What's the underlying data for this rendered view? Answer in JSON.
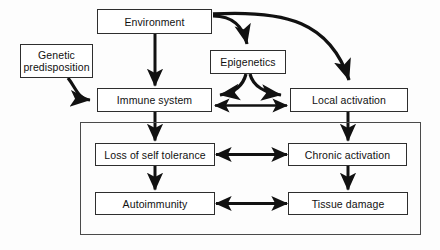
{
  "diagram": {
    "background_color": "#fdfdfd",
    "line_color": "#111111",
    "box_border_color": "#2e2e2e",
    "box_fill_color": "#ffffff",
    "group_border_color": "#4a4a4a",
    "nodes": [
      {
        "id": "environment",
        "label": "Environment",
        "x": 97,
        "y": 9,
        "w": 115,
        "h": 25
      },
      {
        "id": "genetic_predisposition",
        "label": "Genetic\npredisposition",
        "x": 20,
        "y": 44,
        "w": 73,
        "h": 34
      },
      {
        "id": "epigenetics",
        "label": "Epigenetics",
        "x": 210,
        "y": 50,
        "w": 76,
        "h": 24
      },
      {
        "id": "immune_system",
        "label": "Immune system",
        "x": 97,
        "y": 88,
        "w": 115,
        "h": 24
      },
      {
        "id": "local_activation",
        "label": "Local activation",
        "x": 290,
        "y": 88,
        "w": 118,
        "h": 24
      },
      {
        "id": "loss_of_self_tolerance",
        "label": "Loss of self tolerance",
        "x": 95,
        "y": 143,
        "w": 120,
        "h": 23
      },
      {
        "id": "chronic_activation",
        "label": "Chronic activation",
        "x": 288,
        "y": 143,
        "w": 119,
        "h": 23
      },
      {
        "id": "autoimmunity",
        "label": "Autoimmunity",
        "x": 95,
        "y": 192,
        "w": 120,
        "h": 23
      },
      {
        "id": "tissue_damage",
        "label": "Tissue damage",
        "x": 288,
        "y": 192,
        "w": 120,
        "h": 23
      }
    ],
    "group": {
      "id": "disease-process-group",
      "x": 80,
      "y": 122,
      "w": 341,
      "h": 113
    },
    "edges": [
      {
        "id": "environment-to-immune-system",
        "from": "environment",
        "to": "immune_system",
        "style": "straight-vertical",
        "heads": "end"
      },
      {
        "id": "environment-to-epigenetics",
        "from": "environment",
        "to": "epigenetics",
        "style": "curved",
        "heads": "end"
      },
      {
        "id": "environment-to-local-activation",
        "from": "environment",
        "to": "local_activation",
        "style": "curved-long",
        "heads": "end"
      },
      {
        "id": "genetic-predisposition-to-immune-system",
        "from": "genetic_predisposition",
        "to": "immune_system",
        "style": "curved",
        "heads": "end"
      },
      {
        "id": "epigenetics-to-immune-system",
        "from": "epigenetics",
        "to": "immune_system",
        "style": "curved",
        "heads": "end"
      },
      {
        "id": "epigenetics-to-local-activation",
        "from": "epigenetics",
        "to": "local_activation",
        "style": "curved",
        "heads": "end"
      },
      {
        "id": "immune-system-local-activation-bidirectional",
        "from": "immune_system",
        "to": "local_activation",
        "style": "straight-horizontal",
        "heads": "both"
      },
      {
        "id": "immune-system-to-loss-of-self-tolerance",
        "from": "immune_system",
        "to": "loss_of_self_tolerance",
        "style": "straight-vertical",
        "heads": "end"
      },
      {
        "id": "local-activation-to-chronic-activation",
        "from": "local_activation",
        "to": "chronic_activation",
        "style": "straight-vertical",
        "heads": "end"
      },
      {
        "id": "loss-of-self-tolerance-chronic-activation-bidirectional",
        "from": "loss_of_self_tolerance",
        "to": "chronic_activation",
        "style": "straight-horizontal",
        "heads": "both"
      },
      {
        "id": "loss-of-self-tolerance-to-autoimmunity",
        "from": "loss_of_self_tolerance",
        "to": "autoimmunity",
        "style": "straight-vertical",
        "heads": "end"
      },
      {
        "id": "chronic-activation-to-tissue-damage",
        "from": "chronic_activation",
        "to": "tissue_damage",
        "style": "straight-vertical",
        "heads": "end"
      },
      {
        "id": "autoimmunity-tissue-damage-bidirectional",
        "from": "autoimmunity",
        "to": "tissue_damage",
        "style": "straight-horizontal",
        "heads": "both"
      }
    ]
  }
}
